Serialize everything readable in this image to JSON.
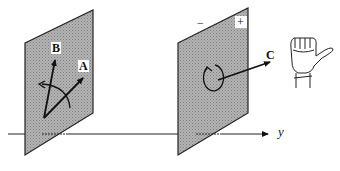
{
  "figure": {
    "axis": {
      "label": "y"
    },
    "left_plane": {
      "vectors": [
        {
          "name": "vector-a",
          "label": "A"
        },
        {
          "name": "vector-b",
          "label": "B"
        }
      ]
    },
    "right_plane": {
      "sign_minus": "−",
      "sign_plus": "+",
      "vector": {
        "name": "vector-c",
        "label": "C"
      }
    },
    "hand": {
      "semantic": "right-hand-rule-icon"
    },
    "colors": {
      "plane_fill": "#a9a9a9",
      "stroke": "#111111",
      "background": "#ffffff"
    }
  }
}
